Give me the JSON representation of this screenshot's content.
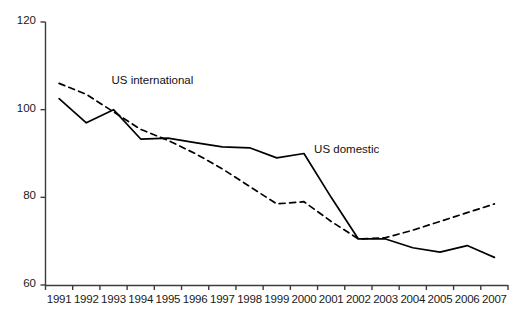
{
  "chart_data": {
    "type": "line",
    "title": "",
    "subtitle": "",
    "xlabel": "",
    "ylabel": "",
    "xlim": [
      1991,
      2007
    ],
    "ylim": [
      60,
      120
    ],
    "yticks": [
      60,
      80,
      100,
      120
    ],
    "grid": false,
    "legend_position": "inline-annotations",
    "categories": [
      "1991",
      "1992",
      "1993",
      "1994",
      "1995",
      "1996",
      "1997",
      "1998",
      "1999",
      "2000",
      "2001",
      "2002",
      "2003",
      "2004",
      "2005",
      "2006",
      "2007"
    ],
    "x": [
      1991,
      1992,
      1993,
      1994,
      1995,
      1996,
      1997,
      1998,
      1999,
      2000,
      2001,
      2002,
      2003,
      2004,
      2005,
      2006,
      2007
    ],
    "series": [
      {
        "name": "US domestic",
        "style": "solid",
        "color": "#000000",
        "values": [
          102.5,
          97.0,
          100.0,
          93.3,
          93.5,
          92.5,
          91.5,
          91.3,
          89.0,
          90.0,
          80.0,
          70.5,
          70.5,
          68.5,
          67.5,
          69.0,
          66.3
        ]
      },
      {
        "name": "US international",
        "style": "dashed",
        "color": "#000000",
        "values": [
          106.0,
          103.5,
          99.5,
          95.5,
          93.0,
          90.0,
          86.5,
          82.5,
          78.5,
          79.0,
          74.5,
          70.5,
          70.8,
          72.5,
          74.5,
          76.5,
          78.5
        ]
      }
    ],
    "annotations": [
      {
        "text": "US international",
        "x": 1993.0,
        "y": 106.2
      },
      {
        "text": "US domestic",
        "x": 2000.3,
        "y": 90.5
      }
    ]
  },
  "axes": {
    "y_tick_labels": [
      "120",
      "100",
      "80",
      "60"
    ],
    "x_tick_labels": [
      "1991",
      "1992",
      "1993",
      "1994",
      "1995",
      "1996",
      "1997",
      "1998",
      "1999",
      "2000",
      "2001",
      "2002",
      "2003",
      "2004",
      "2005",
      "2006",
      "2007"
    ]
  },
  "annotation_labels": {
    "international": "US international",
    "domestic": "US domestic"
  }
}
